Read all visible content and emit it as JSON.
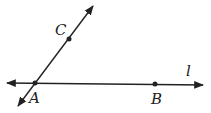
{
  "diagram": {
    "type": "geometry",
    "lines": [
      {
        "name": "line l",
        "through": [
          "A",
          "B"
        ],
        "label": "l"
      },
      {
        "name": "line AC",
        "through": [
          "A",
          "C"
        ]
      }
    ],
    "points": {
      "A": {
        "label": "A",
        "x": 35,
        "y": 83
      },
      "B": {
        "label": "B",
        "x": 155,
        "y": 84
      },
      "C": {
        "label": "C",
        "x": 69,
        "y": 39
      }
    },
    "line_label": "l",
    "colors": {
      "stroke": "#222222",
      "background": "#ffffff"
    }
  }
}
